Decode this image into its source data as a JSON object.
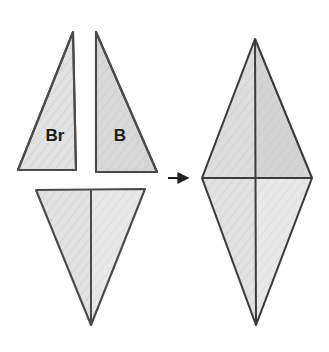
{
  "figure": {
    "background_color": "#ffffff",
    "width": 329,
    "height": 352,
    "stroke_color": "#4a4a4a",
    "stroke_color_dark": "#3c3c3c",
    "fill_light": "#e4e4e4",
    "fill_medium": "#d9d9d9",
    "fill_dark": "#cfcfcf",
    "hatch_color": "#c9c9c9"
  },
  "labels": {
    "br": "Br",
    "b": "B"
  },
  "pieces": [
    {
      "name": "triangle-br",
      "label": "Br",
      "orientation": "right-angle at bottom-right, apex top-right",
      "points": "18,170 76,170 73,32",
      "fill": "#e2e2e2",
      "label_x": 55,
      "label_y": 137
    },
    {
      "name": "triangle-b",
      "label": "B",
      "orientation": "right-angle at bottom-left, apex top-left",
      "points": "96,32 96,172 157,172",
      "fill": "#d8d8d8",
      "label_x": 120,
      "label_y": 137
    },
    {
      "name": "triangle-bottom-left-half",
      "label": "",
      "orientation": "downward pointing, left half",
      "points": "36,190 91,190 91,325",
      "fill": "#e2e2e2",
      "label_x": 0,
      "label_y": 0
    },
    {
      "name": "triangle-bottom-right-half",
      "label": "",
      "orientation": "downward pointing, right half",
      "points": "91,190 145,189 91,325",
      "fill": "#e6e6e6",
      "label_x": 0,
      "label_y": 0
    }
  ],
  "arrow": {
    "name": "transformation-arrow",
    "direction": "right",
    "x1": 168,
    "y1": 178,
    "x2": 190,
    "y2": 178,
    "color": "#1f1f1f"
  },
  "result": {
    "name": "assembled-rhombus",
    "description": "Four triangles assembled into a rhombus divided by vertical and horizontal medians",
    "vertices": {
      "top": "255,39",
      "right": "312,178",
      "bottom": "256,325",
      "left": "202,178"
    },
    "quadrants": [
      {
        "name": "quadrant-top-left",
        "points": "255,39 255,178 202,178",
        "fill": "#dddddd"
      },
      {
        "name": "quadrant-top-right",
        "points": "255,39 312,178 255,178",
        "fill": "#d4d4d4"
      },
      {
        "name": "quadrant-bottom-left",
        "points": "202,178 255,178 256,325",
        "fill": "#e2e2e2"
      },
      {
        "name": "quadrant-bottom-right",
        "points": "255,178 312,178 256,325",
        "fill": "#e8e8e8"
      }
    ],
    "median_vertical": {
      "x1": 255,
      "y1": 39,
      "x2": 256,
      "y2": 325
    },
    "median_horizontal": {
      "x1": 202,
      "y1": 178,
      "x2": 312,
      "y2": 178
    }
  }
}
